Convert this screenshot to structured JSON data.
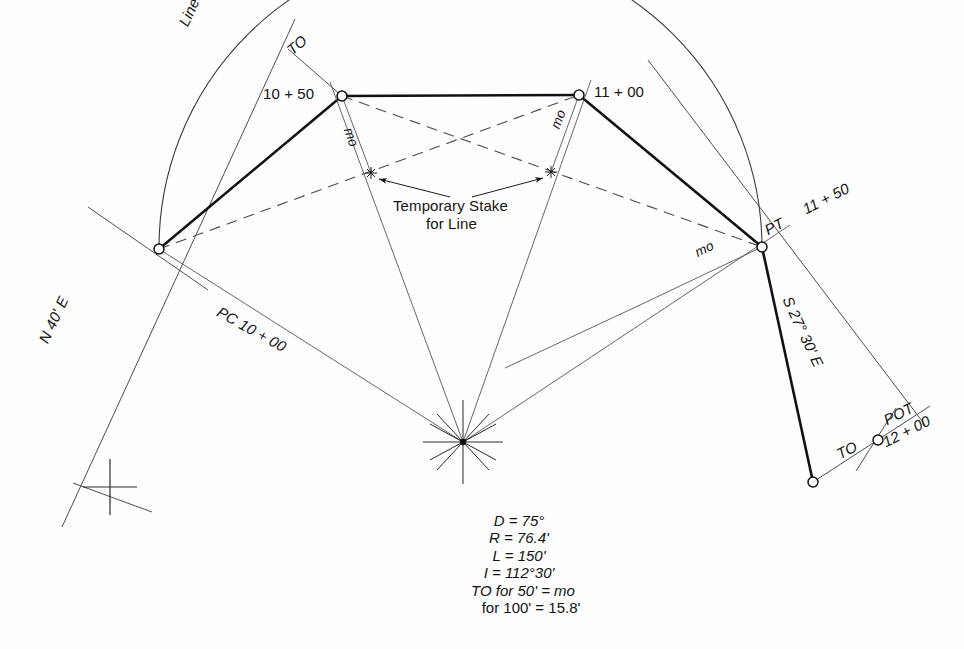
{
  "figure": {
    "kind": "survey-curve-layout",
    "background_color": "#fefefe",
    "ink_color": "#131313",
    "thin_line_color": "#555555"
  },
  "labels": {
    "line_of_tangent": "Line of Tangent",
    "to_top": "TO",
    "station_10_50": "10 + 50",
    "station_11_00": "11 + 00",
    "mo_left": "mo",
    "mo_mid": "mo",
    "mo_right": "mo",
    "temp_stake_line1": "Temporary Stake",
    "temp_stake_line2": "for Line",
    "bearing_back": "N 40' E",
    "pc_station": "PC 10 + 00",
    "pt_label": "PT",
    "station_11_50": "11 + 50",
    "bearing_ahead": "S 27° 30' E",
    "to_bottom": "TO",
    "pot_label": "POT",
    "station_12_00": "12 + 00"
  },
  "formula": {
    "degree_of_curve": "D = 75°",
    "radius": "R = 76.4'",
    "length": "L = 150'",
    "intersection_angle": "I = 112°30'",
    "to_for_50": "TO for 50' = mo",
    "to_for_100": "for 100' = 15.8'",
    "values": {
      "D": "75°",
      "R": "76.4'",
      "L": "150'",
      "I": "112°30'",
      "TO_50": "mo",
      "TO_100": "15.8'"
    }
  },
  "geometry": {
    "points": {
      "pc": {
        "x": 159,
        "y": 249,
        "name": "PC 10 + 00"
      },
      "sta_10_50": {
        "x": 342,
        "y": 96,
        "name": "10 + 50"
      },
      "sta_11_00": {
        "x": 579,
        "y": 95,
        "name": "11 + 00"
      },
      "pt": {
        "x": 762,
        "y": 247,
        "name": "PT 11 + 50"
      },
      "pot": {
        "x": 878,
        "y": 440,
        "name": "POT 12 + 00"
      },
      "to_bottom_node": {
        "x": 813,
        "y": 482,
        "name": "TO offset point"
      },
      "center": {
        "x": 463,
        "y": 442,
        "name": "radius point"
      },
      "stake_left": {
        "x": 371,
        "y": 173,
        "name": "temporary stake left"
      },
      "stake_right": {
        "x": 551,
        "y": 172,
        "name": "temporary stake right"
      },
      "cross_marker": {
        "x": 110,
        "y": 487,
        "name": "tangent cross mark"
      }
    }
  }
}
